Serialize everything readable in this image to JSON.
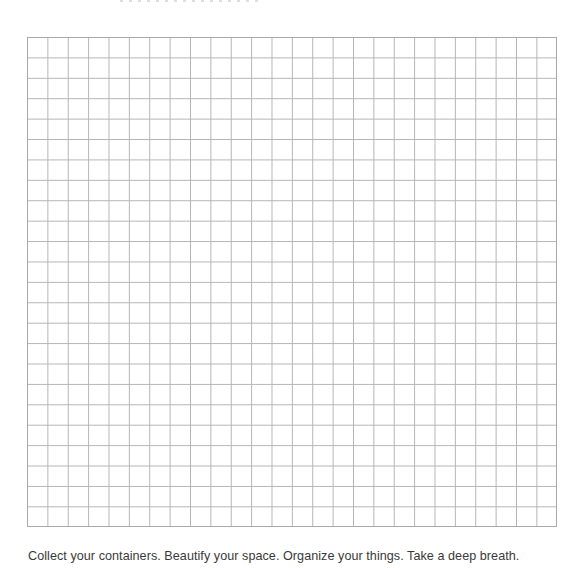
{
  "page": {
    "grid": {
      "columns": 26,
      "rows": 24,
      "line_color": "#b4b4b4",
      "border_color": "#a9a9a9"
    },
    "caption": "Collect your containers. Beautify your space. Organize your things. Take a deep breath."
  }
}
